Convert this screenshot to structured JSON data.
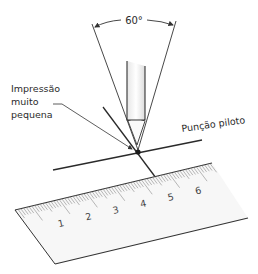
{
  "diagram": {
    "angle_label": "60°",
    "impression_label_lines": [
      "Impressão",
      "muito",
      "pequena"
    ],
    "punch_label": "Punção piloto",
    "ruler_numbers": [
      "1",
      "2",
      "3",
      "4",
      "5",
      "6"
    ],
    "colors": {
      "line": "#2a2a2a",
      "ruler_fill": "#f7f7f7",
      "ruler_tick": "#888888",
      "dot": "#1a1a1a"
    }
  }
}
